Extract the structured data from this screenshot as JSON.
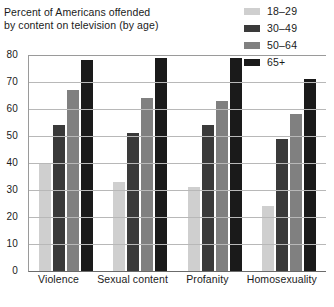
{
  "title": {
    "line1": "Percent of Americans offended",
    "line2": "by content on television (by age)"
  },
  "legend": {
    "position": "top-right",
    "items": [
      {
        "label": "18–29",
        "color": "#cfcfcf"
      },
      {
        "label": "30–49",
        "color": "#3a3a3a"
      },
      {
        "label": "50–64",
        "color": "#808080"
      },
      {
        "label": "65+",
        "color": "#1a1a1a"
      }
    ]
  },
  "yaxis": {
    "ticks": [
      "80",
      "70",
      "60",
      "50",
      "40",
      "30",
      "20",
      "10",
      "0"
    ]
  },
  "chart_data": {
    "type": "bar",
    "title": "Percent of Americans offended by content on television (by age)",
    "xlabel": "",
    "ylabel": "",
    "ylim": [
      0,
      80
    ],
    "ytick_step": 10,
    "grid": true,
    "legend_position": "top-right",
    "categories": [
      "Violence",
      "Sexual content",
      "Profanity",
      "Homosexuality"
    ],
    "series": [
      {
        "name": "18–29",
        "color": "#cfcfcf",
        "values": [
          40,
          33,
          31,
          24
        ]
      },
      {
        "name": "30–49",
        "color": "#3a3a3a",
        "values": [
          54,
          51,
          54,
          49
        ]
      },
      {
        "name": "50–64",
        "color": "#808080",
        "values": [
          67,
          64,
          63,
          58
        ]
      },
      {
        "name": "65+",
        "color": "#1a1a1a",
        "values": [
          78,
          79,
          79,
          71
        ]
      }
    ]
  }
}
